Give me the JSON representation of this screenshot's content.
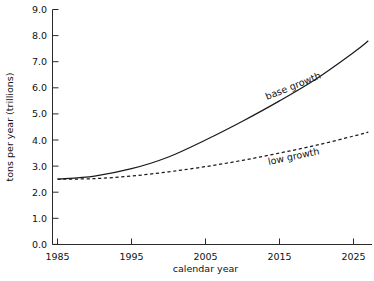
{
  "chart_data": {
    "type": "line",
    "title": "",
    "subtitle": "",
    "xlabel": "calendar year",
    "ylabel": "tons per year (trillions)",
    "xlim": [
      1983,
      1983
    ],
    "ylim": [
      0.0,
      9.0
    ],
    "grid": false,
    "legend_position": "inline-annotations",
    "x_ticks": [
      "1985",
      "1995",
      "2005",
      "2015",
      "2025"
    ],
    "x_tick_values": [
      1985,
      1995,
      2005,
      2015,
      2025
    ],
    "y_ticks": [
      "0.0",
      "1.0",
      "2.0",
      "3.0",
      "4.0",
      "5.0",
      "6.0",
      "7.0",
      "8.0",
      "9.0"
    ],
    "y_tick_values": [
      0.0,
      1.0,
      2.0,
      3.0,
      4.0,
      5.0,
      6.0,
      7.0,
      8.0,
      9.0
    ],
    "x": [
      1985,
      1990,
      1995,
      2000,
      2005,
      2010,
      2015,
      2020,
      2025,
      2027
    ],
    "series": [
      {
        "name": "base growth",
        "style": "solid",
        "values": [
          2.5,
          2.62,
          2.9,
          3.35,
          4.0,
          4.72,
          5.5,
          6.35,
          7.35,
          7.8
        ]
      },
      {
        "name": "low growth",
        "style": "dashed",
        "values": [
          2.5,
          2.52,
          2.62,
          2.78,
          2.98,
          3.22,
          3.5,
          3.8,
          4.15,
          4.3
        ]
      }
    ],
    "annotations": [
      {
        "text": "base growth",
        "x": 2017,
        "y": 5.95,
        "rotation": -22
      },
      {
        "text": "low growth",
        "x": 2017,
        "y": 3.25,
        "rotation": -12
      }
    ]
  }
}
